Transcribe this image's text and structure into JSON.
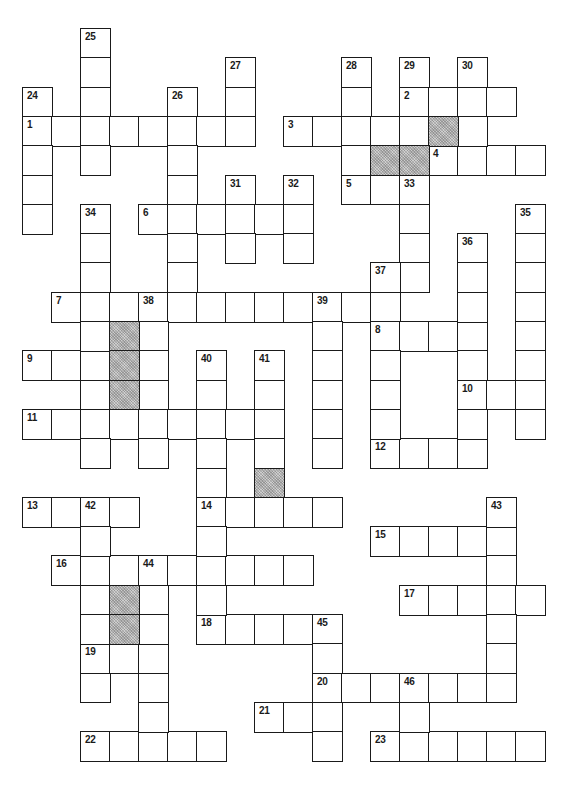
{
  "puzzle": {
    "type": "crossword",
    "grid": {
      "origin_x": 22,
      "origin_y": 28,
      "cell_w": 29.0,
      "cell_h": 29.3,
      "cols": 19,
      "rows": 25
    },
    "colors": {
      "line": "#1a1a1a",
      "cell_bg": "#ffffff",
      "shaded_bg": "#cfcfcf"
    },
    "across": [
      {
        "number": "1",
        "row": 3,
        "col": 0,
        "length": 8
      },
      {
        "number": "2",
        "row": 2,
        "col": 13,
        "length": 4
      },
      {
        "number": "3",
        "row": 3,
        "col": 9,
        "length": 5
      },
      {
        "number": "4",
        "row": 4,
        "col": 14,
        "length": 4
      },
      {
        "number": "5",
        "row": 5,
        "col": 11,
        "length": 3
      },
      {
        "number": "6",
        "row": 6,
        "col": 4,
        "length": 6
      },
      {
        "number": "7",
        "row": 9,
        "col": 1,
        "length": 12
      },
      {
        "number": "8",
        "row": 10,
        "col": 12,
        "length": 4
      },
      {
        "number": "9",
        "row": 11,
        "col": 0,
        "length": 3
      },
      {
        "number": "10",
        "row": 12,
        "col": 15,
        "length": 3
      },
      {
        "number": "11",
        "row": 13,
        "col": 0,
        "length": 9
      },
      {
        "number": "12",
        "row": 14,
        "col": 12,
        "length": 4
      },
      {
        "number": "13",
        "row": 16,
        "col": 0,
        "length": 4
      },
      {
        "number": "14",
        "row": 16,
        "col": 6,
        "length": 5
      },
      {
        "number": "15",
        "row": 17,
        "col": 12,
        "length": 5
      },
      {
        "number": "16",
        "row": 18,
        "col": 1,
        "length": 9
      },
      {
        "number": "17",
        "row": 19,
        "col": 13,
        "length": 5
      },
      {
        "number": "18",
        "row": 20,
        "col": 6,
        "length": 5
      },
      {
        "number": "19",
        "row": 21,
        "col": 2,
        "length": 3
      },
      {
        "number": "20",
        "row": 22,
        "col": 10,
        "length": 7
      },
      {
        "number": "21",
        "row": 23,
        "col": 8,
        "length": 3
      },
      {
        "number": "22",
        "row": 24,
        "col": 2,
        "length": 5
      },
      {
        "number": "23",
        "row": 24,
        "col": 12,
        "length": 6
      }
    ],
    "down": [
      {
        "number": "24",
        "row": 2,
        "col": 0,
        "length": 5
      },
      {
        "number": "25",
        "row": 0,
        "col": 2,
        "length": 5
      },
      {
        "number": "26",
        "row": 2,
        "col": 5,
        "length": 8
      },
      {
        "number": "27",
        "row": 1,
        "col": 7,
        "length": 3
      },
      {
        "number": "28",
        "row": 1,
        "col": 11,
        "length": 5
      },
      {
        "number": "29",
        "row": 1,
        "col": 13,
        "length": 3
      },
      {
        "number": "30",
        "row": 1,
        "col": 15,
        "length": 4
      },
      {
        "number": "31",
        "row": 5,
        "col": 7,
        "length": 3
      },
      {
        "number": "32",
        "row": 5,
        "col": 9,
        "length": 3
      },
      {
        "number": "33",
        "row": 5,
        "col": 13,
        "length": 4
      },
      {
        "number": "34",
        "row": 6,
        "col": 2,
        "length": 9
      },
      {
        "number": "35",
        "row": 6,
        "col": 17,
        "length": 8
      },
      {
        "number": "36",
        "row": 7,
        "col": 15,
        "length": 8
      },
      {
        "number": "37",
        "row": 8,
        "col": 12,
        "length": 7
      },
      {
        "number": "38",
        "row": 9,
        "col": 4,
        "length": 6
      },
      {
        "number": "39",
        "row": 9,
        "col": 10,
        "length": 6
      },
      {
        "number": "40",
        "row": 11,
        "col": 6,
        "length": 10
      },
      {
        "number": "41",
        "row": 11,
        "col": 8,
        "length": 4
      },
      {
        "number": "42",
        "row": 16,
        "col": 2,
        "length": 7
      },
      {
        "number": "43",
        "row": 16,
        "col": 16,
        "length": 7
      },
      {
        "number": "44",
        "row": 18,
        "col": 4,
        "length": 7
      },
      {
        "number": "45",
        "row": 20,
        "col": 10,
        "length": 5
      },
      {
        "number": "46",
        "row": 22,
        "col": 13,
        "length": 3
      }
    ],
    "shaded": [
      {
        "row": 3,
        "col": 14
      },
      {
        "row": 4,
        "col": 12
      },
      {
        "row": 4,
        "col": 13
      },
      {
        "row": 10,
        "col": 3
      },
      {
        "row": 11,
        "col": 3
      },
      {
        "row": 12,
        "col": 3
      },
      {
        "row": 15,
        "col": 8
      },
      {
        "row": 19,
        "col": 3
      },
      {
        "row": 20,
        "col": 3
      }
    ]
  }
}
